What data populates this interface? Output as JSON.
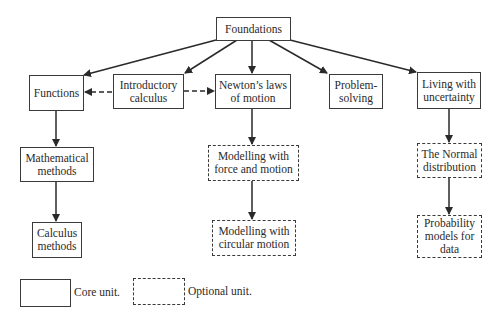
{
  "diagram": {
    "nodes": {
      "foundations": {
        "label": "Foundations",
        "type": "core"
      },
      "functions": {
        "label": "Functions",
        "type": "core"
      },
      "intro_calculus": {
        "label": "Introductory calculus",
        "type": "core"
      },
      "newtons_laws": {
        "label": "Newton’s laws of motion",
        "type": "core"
      },
      "problem_solving": {
        "label": "Problem-solving",
        "type": "core"
      },
      "living_uncertainty": {
        "label": "Living with uncertainty",
        "type": "core"
      },
      "math_methods": {
        "label": "Mathematical methods",
        "type": "core"
      },
      "modelling_force": {
        "label": "Modelling with force and motion",
        "type": "optional"
      },
      "normal_dist": {
        "label": "The Normal distribution",
        "type": "optional"
      },
      "calculus_methods": {
        "label": "Calculus methods",
        "type": "core"
      },
      "modelling_circular": {
        "label": "Modelling with circular motion",
        "type": "optional"
      },
      "probability_models": {
        "label": "Probability models for data",
        "type": "optional"
      }
    },
    "edges": [
      {
        "from": "Foundations",
        "to": "Functions",
        "style": "solid"
      },
      {
        "from": "Foundations",
        "to": "Introductory calculus",
        "style": "solid"
      },
      {
        "from": "Foundations",
        "to": "Newton’s laws of motion",
        "style": "solid"
      },
      {
        "from": "Foundations",
        "to": "Problem-solving",
        "style": "solid"
      },
      {
        "from": "Foundations",
        "to": "Living with uncertainty",
        "style": "solid"
      },
      {
        "from": "Introductory calculus",
        "to": "Functions",
        "style": "dashed"
      },
      {
        "from": "Introductory calculus",
        "to": "Newton’s laws of motion",
        "style": "dashed"
      },
      {
        "from": "Functions",
        "to": "Mathematical methods",
        "style": "solid"
      },
      {
        "from": "Mathematical methods",
        "to": "Calculus methods",
        "style": "solid"
      },
      {
        "from": "Newton’s laws of motion",
        "to": "Modelling with force and motion",
        "style": "solid"
      },
      {
        "from": "Modelling with force and motion",
        "to": "Modelling with circular motion",
        "style": "solid"
      },
      {
        "from": "Living with uncertainty",
        "to": "The Normal distribution",
        "style": "solid"
      },
      {
        "from": "The Normal distribution",
        "to": "Probability models for data",
        "style": "solid"
      }
    ]
  },
  "legend": {
    "core_label": "Core unit.",
    "optional_label": "Optional unit."
  }
}
